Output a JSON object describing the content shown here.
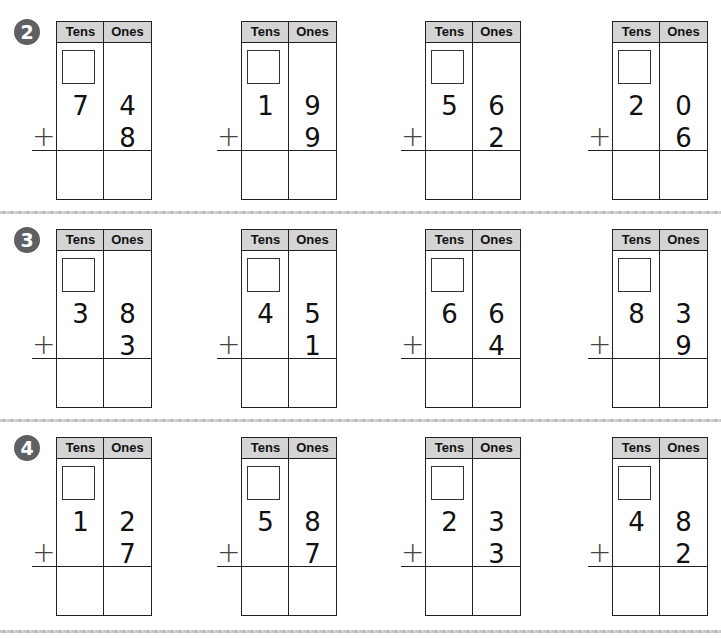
{
  "headers": {
    "tens": "Tens",
    "ones": "Ones"
  },
  "operator": "+",
  "rows": [
    {
      "number": "2",
      "problems": [
        {
          "tens": "7",
          "ones": "4",
          "addend_ones": "8"
        },
        {
          "tens": "1",
          "ones": "9",
          "addend_ones": "9"
        },
        {
          "tens": "5",
          "ones": "6",
          "addend_ones": "2"
        },
        {
          "tens": "2",
          "ones": "0",
          "addend_ones": "6"
        }
      ]
    },
    {
      "number": "3",
      "problems": [
        {
          "tens": "3",
          "ones": "8",
          "addend_ones": "3"
        },
        {
          "tens": "4",
          "ones": "5",
          "addend_ones": "1"
        },
        {
          "tens": "6",
          "ones": "6",
          "addend_ones": "4"
        },
        {
          "tens": "8",
          "ones": "3",
          "addend_ones": "9"
        }
      ]
    },
    {
      "number": "4",
      "problems": [
        {
          "tens": "1",
          "ones": "2",
          "addend_ones": "7"
        },
        {
          "tens": "5",
          "ones": "8",
          "addend_ones": "7"
        },
        {
          "tens": "2",
          "ones": "3",
          "addend_ones": "3"
        },
        {
          "tens": "4",
          "ones": "8",
          "addend_ones": "2"
        }
      ]
    }
  ],
  "colors": {
    "header_bg": "#d4d4d4",
    "badge_bg": "#5f6063",
    "line": "#222222"
  }
}
